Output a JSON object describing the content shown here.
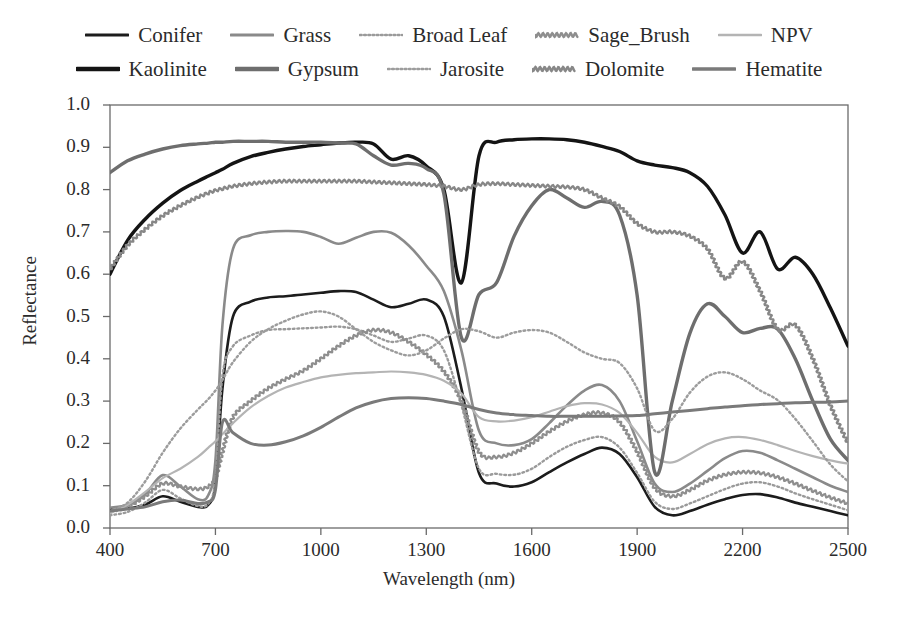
{
  "chart_data": {
    "type": "line",
    "title": "",
    "xlabel": "Wavelength (nm)",
    "ylabel": "Reflectance",
    "xlim": [
      400,
      2500
    ],
    "ylim": [
      0.0,
      1.0
    ],
    "xticks": [
      400,
      700,
      1000,
      1300,
      1600,
      1900,
      2200,
      2500
    ],
    "yticks": [
      "0.0",
      "0.1",
      "0.2",
      "0.3",
      "0.4",
      "0.5",
      "0.6",
      "0.7",
      "0.8",
      "0.9",
      "1.0"
    ],
    "grid": false,
    "legend_position": "top-outside",
    "legend_columns": 5,
    "legend_rows": 2,
    "x": [
      400,
      450,
      500,
      550,
      600,
      650,
      680,
      700,
      720,
      750,
      800,
      850,
      900,
      950,
      1000,
      1050,
      1100,
      1150,
      1200,
      1250,
      1300,
      1350,
      1400,
      1450,
      1500,
      1550,
      1600,
      1650,
      1700,
      1750,
      1800,
      1850,
      1900,
      1950,
      2000,
      2050,
      2100,
      2150,
      2200,
      2250,
      2300,
      2350,
      2400,
      2450,
      2500
    ],
    "series": [
      {
        "name": "Conifer",
        "style": "solid",
        "color": "#1c1c1c",
        "width": 2.6,
        "values": [
          0.045,
          0.046,
          0.055,
          0.075,
          0.062,
          0.05,
          0.055,
          0.105,
          0.33,
          0.5,
          0.535,
          0.545,
          0.548,
          0.552,
          0.556,
          0.56,
          0.558,
          0.54,
          0.522,
          0.53,
          0.54,
          0.5,
          0.33,
          0.13,
          0.105,
          0.098,
          0.108,
          0.132,
          0.155,
          0.175,
          0.19,
          0.175,
          0.12,
          0.05,
          0.03,
          0.04,
          0.055,
          0.068,
          0.078,
          0.08,
          0.072,
          0.06,
          0.05,
          0.04,
          0.03
        ]
      },
      {
        "name": "Grass",
        "style": "solid",
        "color": "#8a8a8a",
        "width": 2.6,
        "values": [
          0.048,
          0.055,
          0.08,
          0.125,
          0.098,
          0.068,
          0.078,
          0.16,
          0.48,
          0.66,
          0.692,
          0.7,
          0.702,
          0.7,
          0.688,
          0.672,
          0.686,
          0.7,
          0.698,
          0.668,
          0.62,
          0.56,
          0.42,
          0.23,
          0.2,
          0.196,
          0.21,
          0.248,
          0.29,
          0.325,
          0.338,
          0.3,
          0.205,
          0.105,
          0.085,
          0.105,
          0.135,
          0.165,
          0.182,
          0.178,
          0.16,
          0.14,
          0.12,
          0.1,
          0.085
        ]
      },
      {
        "name": "Broad Leaf",
        "style": "dotted",
        "color": "#9a9a9a",
        "width": 2.4,
        "values": [
          0.03,
          0.038,
          0.06,
          0.09,
          0.07,
          0.052,
          0.058,
          0.115,
          0.36,
          0.43,
          0.455,
          0.468,
          0.47,
          0.472,
          0.474,
          0.476,
          0.47,
          0.455,
          0.44,
          0.448,
          0.455,
          0.42,
          0.29,
          0.14,
          0.128,
          0.126,
          0.14,
          0.168,
          0.192,
          0.208,
          0.215,
          0.19,
          0.13,
          0.062,
          0.045,
          0.058,
          0.075,
          0.092,
          0.105,
          0.108,
          0.098,
          0.082,
          0.068,
          0.055,
          0.042
        ]
      },
      {
        "name": "Sage_Brush",
        "style": "wavy",
        "color": "#8e8e8e",
        "width": 2.2,
        "values": [
          0.04,
          0.05,
          0.075,
          0.105,
          0.098,
          0.092,
          0.098,
          0.118,
          0.18,
          0.262,
          0.3,
          0.33,
          0.352,
          0.372,
          0.4,
          0.43,
          0.455,
          0.468,
          0.462,
          0.44,
          0.41,
          0.37,
          0.3,
          0.18,
          0.168,
          0.178,
          0.2,
          0.228,
          0.252,
          0.268,
          0.272,
          0.25,
          0.18,
          0.095,
          0.075,
          0.09,
          0.112,
          0.126,
          0.132,
          0.13,
          0.12,
          0.105,
          0.088,
          0.072,
          0.058
        ]
      },
      {
        "name": "NPV",
        "style": "solid",
        "color": "#b4b4b4",
        "width": 2.2,
        "values": [
          0.035,
          0.055,
          0.085,
          0.118,
          0.14,
          0.168,
          0.19,
          0.205,
          0.222,
          0.248,
          0.285,
          0.312,
          0.332,
          0.345,
          0.356,
          0.362,
          0.366,
          0.368,
          0.37,
          0.368,
          0.362,
          0.348,
          0.318,
          0.262,
          0.252,
          0.254,
          0.262,
          0.275,
          0.288,
          0.295,
          0.292,
          0.272,
          0.225,
          0.168,
          0.155,
          0.175,
          0.198,
          0.212,
          0.215,
          0.208,
          0.196,
          0.182,
          0.17,
          0.16,
          0.152
        ]
      },
      {
        "name": "Kaolinite",
        "style": "solid",
        "color": "#141414",
        "width": 3.4,
        "values": [
          0.6,
          0.68,
          0.73,
          0.768,
          0.798,
          0.82,
          0.832,
          0.84,
          0.848,
          0.862,
          0.878,
          0.888,
          0.896,
          0.902,
          0.906,
          0.91,
          0.912,
          0.908,
          0.872,
          0.88,
          0.856,
          0.8,
          0.58,
          0.88,
          0.912,
          0.918,
          0.92,
          0.92,
          0.918,
          0.912,
          0.902,
          0.89,
          0.868,
          0.858,
          0.852,
          0.84,
          0.808,
          0.74,
          0.65,
          0.7,
          0.612,
          0.64,
          0.6,
          0.52,
          0.43
        ]
      },
      {
        "name": "Gypsum",
        "style": "solid",
        "color": "#6e6e6e",
        "width": 3.4,
        "values": [
          0.84,
          0.868,
          0.884,
          0.896,
          0.904,
          0.908,
          0.91,
          0.912,
          0.912,
          0.914,
          0.914,
          0.914,
          0.912,
          0.912,
          0.912,
          0.91,
          0.908,
          0.88,
          0.858,
          0.862,
          0.85,
          0.79,
          0.45,
          0.552,
          0.58,
          0.69,
          0.762,
          0.8,
          0.78,
          0.758,
          0.772,
          0.74,
          0.55,
          0.132,
          0.3,
          0.46,
          0.53,
          0.5,
          0.462,
          0.472,
          0.47,
          0.4,
          0.3,
          0.21,
          0.16
        ]
      },
      {
        "name": "Jarosite",
        "style": "dotted",
        "color": "#9c9c9c",
        "width": 2.4,
        "values": [
          0.04,
          0.06,
          0.11,
          0.178,
          0.235,
          0.28,
          0.305,
          0.325,
          0.35,
          0.392,
          0.44,
          0.47,
          0.49,
          0.505,
          0.512,
          0.5,
          0.47,
          0.44,
          0.42,
          0.408,
          0.42,
          0.448,
          0.47,
          0.465,
          0.45,
          0.462,
          0.468,
          0.462,
          0.44,
          0.415,
          0.4,
          0.39,
          0.33,
          0.23,
          0.258,
          0.32,
          0.358,
          0.368,
          0.352,
          0.325,
          0.302,
          0.258,
          0.205,
          0.15,
          0.11
        ]
      },
      {
        "name": "Dolomite",
        "style": "wavy",
        "color": "#878787",
        "width": 2.3,
        "values": [
          0.612,
          0.668,
          0.706,
          0.738,
          0.762,
          0.782,
          0.792,
          0.798,
          0.802,
          0.808,
          0.814,
          0.818,
          0.82,
          0.82,
          0.82,
          0.82,
          0.82,
          0.818,
          0.816,
          0.814,
          0.812,
          0.808,
          0.8,
          0.812,
          0.814,
          0.812,
          0.81,
          0.808,
          0.806,
          0.8,
          0.78,
          0.76,
          0.72,
          0.7,
          0.7,
          0.69,
          0.66,
          0.59,
          0.63,
          0.56,
          0.47,
          0.48,
          0.4,
          0.29,
          0.2
        ]
      },
      {
        "name": "Hematite",
        "style": "solid",
        "color": "#7a7a7a",
        "width": 3.0,
        "values": [
          0.04,
          0.045,
          0.05,
          0.062,
          0.066,
          0.058,
          0.062,
          0.09,
          0.25,
          0.225,
          0.2,
          0.196,
          0.204,
          0.218,
          0.238,
          0.262,
          0.284,
          0.298,
          0.306,
          0.308,
          0.306,
          0.3,
          0.292,
          0.28,
          0.272,
          0.268,
          0.266,
          0.264,
          0.264,
          0.264,
          0.264,
          0.265,
          0.266,
          0.27,
          0.274,
          0.278,
          0.282,
          0.286,
          0.289,
          0.292,
          0.294,
          0.296,
          0.297,
          0.298,
          0.3
        ]
      }
    ]
  },
  "legend": {
    "rows": [
      [
        {
          "label": "Conifer",
          "style": "solid",
          "color": "#1c1c1c",
          "width": 3
        },
        {
          "label": "Grass",
          "style": "solid",
          "color": "#8a8a8a",
          "width": 3
        },
        {
          "label": "Broad Leaf",
          "style": "dotted",
          "color": "#9a9a9a",
          "width": 2.6
        },
        {
          "label": "Sage_Brush",
          "style": "wavy",
          "color": "#8e8e8e",
          "width": 2.4
        },
        {
          "label": "NPV",
          "style": "solid",
          "color": "#b4b4b4",
          "width": 2.6
        }
      ],
      [
        {
          "label": "Kaolinite",
          "style": "solid",
          "color": "#141414",
          "width": 4.4
        },
        {
          "label": "Gypsum",
          "style": "solid",
          "color": "#6e6e6e",
          "width": 4.4
        },
        {
          "label": "Jarosite",
          "style": "dotted",
          "color": "#9c9c9c",
          "width": 2.6
        },
        {
          "label": "Dolomite",
          "style": "wavy",
          "color": "#878787",
          "width": 2.5
        },
        {
          "label": "Hematite",
          "style": "solid",
          "color": "#7a7a7a",
          "width": 3.4
        }
      ]
    ]
  }
}
